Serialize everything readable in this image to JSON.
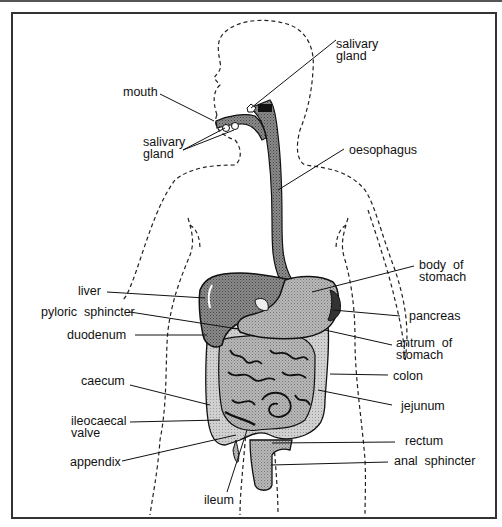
{
  "diagram": {
    "type": "anatomical-diagram",
    "labels": {
      "salivary_gland_top": [
        "salivary",
        "gland"
      ],
      "mouth": "mouth",
      "salivary_gland_lower": [
        "salivary",
        "gland"
      ],
      "oesophagus": "oesophagus",
      "liver": "liver",
      "pyloric_sphincter": "pyloric  sphincter",
      "duodenum": "duodenum",
      "caecum": "caecum",
      "ileocaecal_valve": [
        "ileocaecal",
        "valve"
      ],
      "appendix": "appendix",
      "ileum": "ileum",
      "body_of_stomach": [
        "body  of",
        "stomach"
      ],
      "pancreas": "pancreas",
      "antrum_of_stomach": [
        "antrum  of",
        "stomach"
      ],
      "colon": "colon",
      "jejunum": "jejunum",
      "rectum": "rectum",
      "anal_sphincter": "anal  sphincter"
    },
    "colors": {
      "organ_dark": "#6e6e6e",
      "organ_mid": "#9a9a9a",
      "organ_light": "#c4c4c4",
      "outline": "#111111",
      "frame": "#333333"
    }
  }
}
